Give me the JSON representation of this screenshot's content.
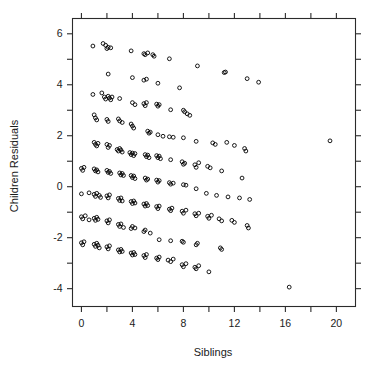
{
  "figure": {
    "title": "",
    "background_color": "#ffffff",
    "frame_color": "#2b2b2b",
    "marker_color": "#000000"
  },
  "chart_data": {
    "type": "scatter",
    "title": "",
    "xlabel": "Siblings",
    "ylabel": "Children Residuals",
    "xlim": [
      -0.7,
      21.5
    ],
    "ylim": [
      -4.7,
      6.6
    ],
    "grid": false,
    "legend": null,
    "marker": "open-circle",
    "xticks_major": [
      0,
      4,
      8,
      12,
      16,
      20
    ],
    "xticks_minor": [
      2,
      6,
      10,
      14,
      18
    ],
    "xtick_labels": [
      "0",
      "4",
      "8",
      "12",
      "16",
      "20"
    ],
    "yticks_major": [
      6,
      4,
      2,
      0,
      -2,
      -4
    ],
    "yticks_minor": [
      5,
      3,
      1,
      -1,
      -3
    ],
    "ytick_labels": [
      "6",
      "4",
      "2",
      "0",
      "-2",
      "-4"
    ],
    "points": [
      [
        0.9,
        5.52
      ],
      [
        1.7,
        5.62
      ],
      [
        1.9,
        5.55
      ],
      [
        2.0,
        5.42
      ],
      [
        2.1,
        5.47
      ],
      [
        2.3,
        5.45
      ],
      [
        3.9,
        5.33
      ],
      [
        4.9,
        5.22
      ],
      [
        5.0,
        5.18
      ],
      [
        5.2,
        5.25
      ],
      [
        5.6,
        5.18
      ],
      [
        5.7,
        5.12
      ],
      [
        6.9,
        5.02
      ],
      [
        9.1,
        4.74
      ],
      [
        11.2,
        4.48
      ],
      [
        11.3,
        4.5
      ],
      [
        13.0,
        4.24
      ],
      [
        13.9,
        4.1
      ],
      [
        2.1,
        4.42
      ],
      [
        4.0,
        4.28
      ],
      [
        4.9,
        4.18
      ],
      [
        5.1,
        4.22
      ],
      [
        6.0,
        4.06
      ],
      [
        7.7,
        3.88
      ],
      [
        0.9,
        3.62
      ],
      [
        1.6,
        3.68
      ],
      [
        1.8,
        3.52
      ],
      [
        1.9,
        3.44
      ],
      [
        2.1,
        3.55
      ],
      [
        2.2,
        3.48
      ],
      [
        2.3,
        3.41
      ],
      [
        2.4,
        3.52
      ],
      [
        3.0,
        3.46
      ],
      [
        4.0,
        3.3
      ],
      [
        4.2,
        3.22
      ],
      [
        4.9,
        3.26
      ],
      [
        5.0,
        3.18
      ],
      [
        5.1,
        3.3
      ],
      [
        5.9,
        3.24
      ],
      [
        6.0,
        3.16
      ],
      [
        6.1,
        3.22
      ],
      [
        7.0,
        3.02
      ],
      [
        8.0,
        3.0
      ],
      [
        8.1,
        2.94
      ],
      [
        8.3,
        2.86
      ],
      [
        8.5,
        2.8
      ],
      [
        1.0,
        2.82
      ],
      [
        1.1,
        2.7
      ],
      [
        1.2,
        2.62
      ],
      [
        2.0,
        2.64
      ],
      [
        2.1,
        2.56
      ],
      [
        2.9,
        2.66
      ],
      [
        3.0,
        2.58
      ],
      [
        3.2,
        2.52
      ],
      [
        3.9,
        2.46
      ],
      [
        4.0,
        2.38
      ],
      [
        4.1,
        2.3
      ],
      [
        5.2,
        2.18
      ],
      [
        5.3,
        2.1
      ],
      [
        5.4,
        2.14
      ],
      [
        6.0,
        2.04
      ],
      [
        6.4,
        1.98
      ],
      [
        6.9,
        1.96
      ],
      [
        7.2,
        1.94
      ],
      [
        8.0,
        1.92
      ],
      [
        9.0,
        1.78
      ],
      [
        10.3,
        1.72
      ],
      [
        10.5,
        1.66
      ],
      [
        11.4,
        1.74
      ],
      [
        12.0,
        1.62
      ],
      [
        12.8,
        1.5
      ],
      [
        12.9,
        1.4
      ],
      [
        19.5,
        1.8
      ],
      [
        1.0,
        1.74
      ],
      [
        1.1,
        1.66
      ],
      [
        1.2,
        1.6
      ],
      [
        1.3,
        1.7
      ],
      [
        2.0,
        1.66
      ],
      [
        2.1,
        1.54
      ],
      [
        2.2,
        1.62
      ],
      [
        2.8,
        1.46
      ],
      [
        2.9,
        1.4
      ],
      [
        3.0,
        1.5
      ],
      [
        3.1,
        1.44
      ],
      [
        3.2,
        1.36
      ],
      [
        3.8,
        1.34
      ],
      [
        3.9,
        1.26
      ],
      [
        4.0,
        1.32
      ],
      [
        4.1,
        1.22
      ],
      [
        4.2,
        1.3
      ],
      [
        5.0,
        1.26
      ],
      [
        5.1,
        1.18
      ],
      [
        5.2,
        1.24
      ],
      [
        5.3,
        1.14
      ],
      [
        5.9,
        1.22
      ],
      [
        6.0,
        1.14
      ],
      [
        6.1,
        1.2
      ],
      [
        6.2,
        1.1
      ],
      [
        7.0,
        1.06
      ],
      [
        7.9,
        0.98
      ],
      [
        8.0,
        0.88
      ],
      [
        8.1,
        0.92
      ],
      [
        8.9,
        0.86
      ],
      [
        9.0,
        0.76
      ],
      [
        9.2,
        0.94
      ],
      [
        9.9,
        0.8
      ],
      [
        10.1,
        0.74
      ],
      [
        11.0,
        0.62
      ],
      [
        12.6,
        0.34
      ],
      [
        0.0,
        0.72
      ],
      [
        0.1,
        0.64
      ],
      [
        0.2,
        0.76
      ],
      [
        1.0,
        0.7
      ],
      [
        1.1,
        0.62
      ],
      [
        1.2,
        0.66
      ],
      [
        1.3,
        0.58
      ],
      [
        2.0,
        0.64
      ],
      [
        2.1,
        0.56
      ],
      [
        2.2,
        0.6
      ],
      [
        2.3,
        0.52
      ],
      [
        3.0,
        0.54
      ],
      [
        3.1,
        0.46
      ],
      [
        3.2,
        0.52
      ],
      [
        3.3,
        0.44
      ],
      [
        3.9,
        0.44
      ],
      [
        4.0,
        0.36
      ],
      [
        4.1,
        0.42
      ],
      [
        4.2,
        0.32
      ],
      [
        5.0,
        0.34
      ],
      [
        5.1,
        0.26
      ],
      [
        5.2,
        0.3
      ],
      [
        5.9,
        0.26
      ],
      [
        6.0,
        0.18
      ],
      [
        6.1,
        0.24
      ],
      [
        6.9,
        0.16
      ],
      [
        7.0,
        0.1
      ],
      [
        7.2,
        0.14
      ],
      [
        8.0,
        0.08
      ],
      [
        8.2,
        0.06
      ],
      [
        9.0,
        -0.08
      ],
      [
        9.8,
        -0.26
      ],
      [
        10.6,
        -0.34
      ],
      [
        11.5,
        -0.4
      ],
      [
        12.4,
        -0.44
      ],
      [
        13.2,
        -0.5
      ],
      [
        0.0,
        -0.28
      ],
      [
        0.6,
        -0.24
      ],
      [
        1.0,
        -0.3
      ],
      [
        1.1,
        -0.38
      ],
      [
        1.2,
        -0.26
      ],
      [
        1.4,
        -0.34
      ],
      [
        1.5,
        -0.42
      ],
      [
        2.0,
        -0.36
      ],
      [
        2.1,
        -0.44
      ],
      [
        2.2,
        -0.32
      ],
      [
        2.9,
        -0.46
      ],
      [
        3.0,
        -0.54
      ],
      [
        3.1,
        -0.44
      ],
      [
        3.2,
        -0.56
      ],
      [
        3.9,
        -0.58
      ],
      [
        4.0,
        -0.66
      ],
      [
        4.1,
        -0.56
      ],
      [
        4.2,
        -0.64
      ],
      [
        4.9,
        -0.68
      ],
      [
        5.0,
        -0.76
      ],
      [
        5.1,
        -0.66
      ],
      [
        5.2,
        -0.74
      ],
      [
        5.9,
        -0.78
      ],
      [
        6.0,
        -0.86
      ],
      [
        6.1,
        -0.76
      ],
      [
        6.9,
        -0.88
      ],
      [
        7.0,
        -0.94
      ],
      [
        7.1,
        -0.84
      ],
      [
        7.9,
        -0.96
      ],
      [
        8.0,
        -1.04
      ],
      [
        8.2,
        -0.92
      ],
      [
        8.9,
        -1.06
      ],
      [
        9.0,
        -1.14
      ],
      [
        9.2,
        -1.04
      ],
      [
        9.9,
        -1.16
      ],
      [
        10.0,
        -1.24
      ],
      [
        10.2,
        -1.12
      ],
      [
        10.8,
        -1.26
      ],
      [
        11.0,
        -1.34
      ],
      [
        11.8,
        -1.32
      ],
      [
        12.0,
        -1.4
      ],
      [
        13.0,
        -1.52
      ],
      [
        13.1,
        -1.62
      ],
      [
        0.0,
        -1.18
      ],
      [
        0.1,
        -1.26
      ],
      [
        0.3,
        -1.14
      ],
      [
        0.6,
        -1.3
      ],
      [
        1.0,
        -1.24
      ],
      [
        1.1,
        -1.32
      ],
      [
        1.2,
        -1.2
      ],
      [
        1.3,
        -1.28
      ],
      [
        2.0,
        -1.34
      ],
      [
        2.1,
        -1.42
      ],
      [
        2.2,
        -1.3
      ],
      [
        2.9,
        -1.48
      ],
      [
        3.0,
        -1.56
      ],
      [
        3.1,
        -1.46
      ],
      [
        3.3,
        -1.6
      ],
      [
        3.9,
        -1.64
      ],
      [
        4.0,
        -1.56
      ],
      [
        4.2,
        -1.62
      ],
      [
        4.9,
        -1.76
      ],
      [
        5.0,
        -1.7
      ],
      [
        5.4,
        -1.82
      ],
      [
        6.1,
        -2.08
      ],
      [
        7.0,
        -2.12
      ],
      [
        7.9,
        -2.14
      ],
      [
        8.0,
        -2.18
      ],
      [
        9.0,
        -2.28
      ],
      [
        9.1,
        -2.22
      ],
      [
        10.9,
        -2.4
      ],
      [
        11.0,
        -2.46
      ],
      [
        0.0,
        -2.2
      ],
      [
        0.1,
        -2.28
      ],
      [
        0.2,
        -2.16
      ],
      [
        1.0,
        -2.26
      ],
      [
        1.1,
        -2.34
      ],
      [
        1.2,
        -2.22
      ],
      [
        1.3,
        -2.3
      ],
      [
        1.4,
        -2.4
      ],
      [
        2.0,
        -2.36
      ],
      [
        2.1,
        -2.44
      ],
      [
        2.2,
        -2.32
      ],
      [
        2.9,
        -2.48
      ],
      [
        3.0,
        -2.56
      ],
      [
        3.1,
        -2.46
      ],
      [
        3.2,
        -2.54
      ],
      [
        3.9,
        -2.6
      ],
      [
        4.0,
        -2.68
      ],
      [
        4.1,
        -2.58
      ],
      [
        4.2,
        -2.66
      ],
      [
        4.9,
        -2.7
      ],
      [
        5.0,
        -2.78
      ],
      [
        5.1,
        -2.66
      ],
      [
        5.9,
        -2.8
      ],
      [
        6.0,
        -2.86
      ],
      [
        6.1,
        -2.76
      ],
      [
        6.8,
        -2.88
      ],
      [
        7.0,
        -2.94
      ],
      [
        7.2,
        -2.84
      ],
      [
        7.9,
        -3.06
      ],
      [
        8.0,
        -3.14
      ],
      [
        8.2,
        -3.02
      ],
      [
        8.9,
        -3.16
      ],
      [
        9.0,
        -3.22
      ],
      [
        9.2,
        -3.1
      ],
      [
        10.0,
        -3.34
      ],
      [
        16.3,
        -3.94
      ]
    ]
  },
  "labels": {
    "xlabel": "Siblings",
    "ylabel": "Children Residuals"
  }
}
